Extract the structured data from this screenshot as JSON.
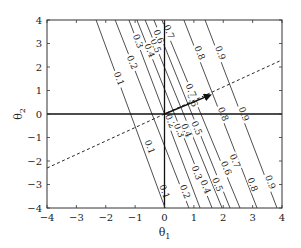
{
  "chart_data": {
    "type": "line",
    "title": "",
    "xlabel": "θ1",
    "ylabel": "θ2",
    "xlim": [
      -4,
      4
    ],
    "ylim": [
      -4,
      4
    ],
    "xticks": [
      -4,
      -3,
      -2,
      -1,
      0,
      1,
      2,
      3,
      4
    ],
    "yticks": [
      -4,
      -3,
      -2,
      -1,
      0,
      1,
      2,
      3,
      4
    ],
    "xtick_labels": [
      "−4",
      "−3",
      "−2",
      "−1",
      "0",
      "1",
      "2",
      "3",
      "4"
    ],
    "ytick_labels": [
      "−4",
      "−3",
      "−2",
      "−1",
      "0",
      "1",
      "2",
      "3",
      "4"
    ],
    "grid": false,
    "legend": null,
    "contours": [
      {
        "level": "0.1",
        "top": [
          -2.33,
          4
        ],
        "bottom": [
          0.02,
          -4
        ],
        "labels": [
          [
            -1.55,
            1.5
          ],
          [
            -0.5,
            -1.4
          ],
          [
            0.0,
            -3.3
          ]
        ]
      },
      {
        "level": "0.2",
        "top": [
          -1.68,
          4
        ],
        "bottom": [
          0.83,
          -4
        ],
        "labels": [
          [
            -1.1,
            2.2
          ],
          [
            0.2,
            -0.3
          ],
          [
            0.7,
            -3.3
          ]
        ]
      },
      {
        "level": "0.3",
        "top": [
          -1.21,
          4
        ],
        "bottom": [
          1.21,
          -4
        ],
        "labels": [
          [
            -0.9,
            3.1
          ],
          [
            0.5,
            -0.7
          ],
          [
            1.1,
            -2.5
          ]
        ]
      },
      {
        "level": "0.4",
        "top": [
          -0.94,
          4
        ],
        "bottom": [
          1.62,
          -4
        ],
        "labels": [
          [
            -0.5,
            2.7
          ],
          [
            0.75,
            -0.7
          ],
          [
            1.4,
            -3.1
          ]
        ]
      },
      {
        "level": "0.5",
        "top": [
          -0.66,
          4
        ],
        "bottom": [
          1.96,
          -4
        ],
        "labels": [
          [
            -0.3,
            2.9
          ],
          [
            1.1,
            -0.6
          ],
          [
            1.8,
            -3.0
          ]
        ]
      },
      {
        "level": "0.6",
        "top": [
          -0.36,
          4
        ],
        "bottom": [
          2.23,
          -4
        ],
        "labels": [
          [
            -0.2,
            3.3
          ],
          [
            0.95,
            0.6
          ],
          [
            2.1,
            -2.3
          ]
        ]
      },
      {
        "level": "0.7",
        "top": [
          -0.09,
          4
        ],
        "bottom": [
          2.57,
          -4
        ],
        "labels": [
          [
            0.15,
            3.5
          ],
          [
            0.9,
            1.0
          ],
          [
            2.4,
            -2.0
          ]
        ]
      },
      {
        "level": "0.8",
        "top": [
          0.66,
          4
        ],
        "bottom": [
          3.15,
          -4
        ],
        "labels": [
          [
            1.2,
            2.6
          ],
          [
            2.0,
            0.0
          ],
          [
            3.0,
            -3.0
          ]
        ]
      },
      {
        "level": "0.9",
        "top": [
          1.38,
          4
        ],
        "bottom": [
          3.83,
          -4
        ],
        "labels": [
          [
            1.9,
            2.6
          ],
          [
            2.7,
            0.0
          ],
          [
            3.6,
            -2.9
          ]
        ]
      }
    ],
    "dashed_line": {
      "from": [
        -4,
        -2.3
      ],
      "to": [
        4,
        2.3
      ]
    },
    "arrow": {
      "from": [
        0,
        0
      ],
      "to": [
        1.55,
        0.8
      ]
    },
    "axes_cross": {
      "hline_y": 0,
      "vline_x": 0
    }
  }
}
